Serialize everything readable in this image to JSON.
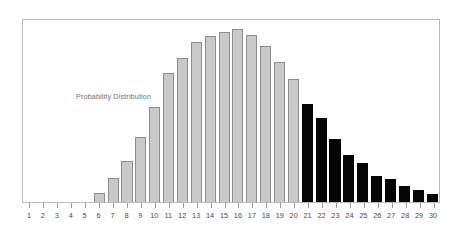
{
  "chart_data": {
    "type": "bar",
    "title": "",
    "annotation": "Probability Distribution",
    "xlabel": "",
    "ylabel": "",
    "grid": false,
    "legend": false,
    "axis": {
      "x_range": [
        1,
        30
      ],
      "y_range": [
        0,
        0.092
      ],
      "x_tick_labels": [
        "1",
        "2",
        "3",
        "4",
        "5",
        "6",
        "7",
        "8",
        "9",
        "10",
        "11",
        "12",
        "13",
        "14",
        "15",
        "16",
        "17",
        "18",
        "19",
        "20",
        "21",
        "22",
        "23",
        "24",
        "25",
        "26",
        "27",
        "28",
        "29",
        "30"
      ],
      "y_tick_labels": []
    },
    "colors": {
      "bar_light": "#c9c9c9",
      "bar_light_edge": "#8d8d8d",
      "bar_dark": "#050505",
      "frame": "#b9b9b9",
      "tick": "#9a9a9a",
      "label_text": "#4a4a4a",
      "annotation_text": "#6e6e6e"
    },
    "categories": [
      "1",
      "2",
      "3",
      "4",
      "5",
      "6",
      "7",
      "8",
      "9",
      "10",
      "11",
      "12",
      "13",
      "14",
      "15",
      "16",
      "17",
      "18",
      "19",
      "20",
      "21",
      "22",
      "23",
      "24",
      "25",
      "26",
      "27",
      "28",
      "29",
      "30"
    ],
    "values": [
      0,
      0,
      0,
      0,
      0,
      0.0046,
      0.012,
      0.0208,
      0.033,
      0.0482,
      0.065,
      0.073,
      0.081,
      0.084,
      0.086,
      0.0875,
      0.0845,
      0.079,
      0.071,
      0.062,
      0.0495,
      0.0425,
      0.032,
      0.024,
      0.0195,
      0.013,
      0.0115,
      0.008,
      0.006,
      0.004
    ],
    "bar_styles": [
      "light",
      "light",
      "light",
      "light",
      "light",
      "light",
      "light",
      "light",
      "light",
      "light",
      "light",
      "light",
      "light",
      "light",
      "light",
      "light",
      "light",
      "light",
      "light",
      "light",
      "dark",
      "dark",
      "dark",
      "dark",
      "dark",
      "dark",
      "dark",
      "dark",
      "dark",
      "dark"
    ],
    "split_index": 20,
    "split_note": "Bars 1-20 light gray; bars 21-30 solid black (upper tail highlighted)"
  }
}
